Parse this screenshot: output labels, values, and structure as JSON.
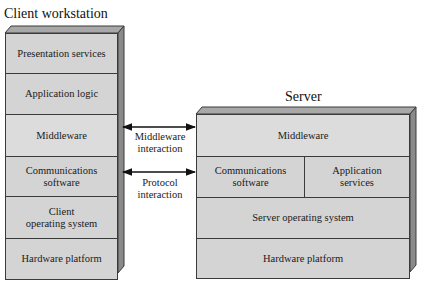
{
  "client": {
    "title": "Client workstation",
    "layers": [
      {
        "label": "Presentation services"
      },
      {
        "label": "Application logic"
      },
      {
        "label": "Middleware"
      },
      {
        "label": "Communications software"
      },
      {
        "label": "Client operating system"
      },
      {
        "label": "Hardware platform"
      }
    ],
    "layer_lines": {
      "comms": [
        "Communications",
        "software"
      ],
      "os": [
        "Client",
        "operating system"
      ]
    }
  },
  "server": {
    "title": "Server",
    "layers": {
      "middleware": "Middleware",
      "comms": [
        "Communications",
        "software"
      ],
      "app": [
        "Application",
        "services"
      ],
      "os": "Server operating system",
      "hardware": "Hardware platform"
    }
  },
  "interactions": [
    {
      "lines": [
        "Middleware",
        "interaction"
      ]
    },
    {
      "lines": [
        "Protocol",
        "interaction"
      ]
    }
  ],
  "colors": {
    "face": "#d4d4d4",
    "top": "#a8a8a8",
    "side": "#8a8a8a",
    "line": "#3a3a3a"
  }
}
